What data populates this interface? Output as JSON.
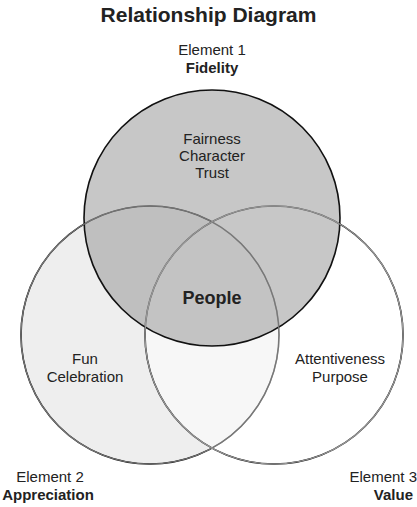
{
  "title": "Relationship Diagram",
  "elements": [
    {
      "label": "Element 1",
      "name": "Fidelity",
      "items": [
        "Fairness",
        "Character",
        "Trust"
      ],
      "fill": "#b5b5b5"
    },
    {
      "label": "Element 2",
      "name": "Appreciation",
      "items": [
        "Fun",
        "Celebration"
      ],
      "fill": "#ececec"
    },
    {
      "label": "Element 3",
      "name": "Value",
      "items": [
        "Attentiveness",
        "Purpose"
      ],
      "fill": "#ffffff"
    }
  ],
  "center": "People"
}
